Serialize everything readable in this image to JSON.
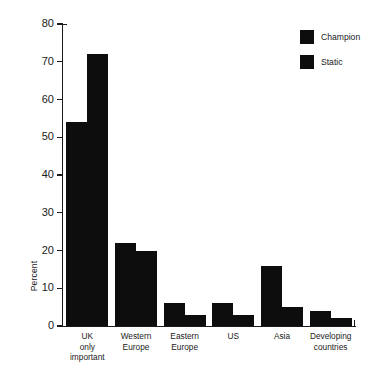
{
  "chart_data": {
    "type": "bar",
    "title": "",
    "xlabel": "",
    "ylabel": "Percent",
    "ylim": [
      0,
      80
    ],
    "ytick_step": 10,
    "grid": false,
    "legend_position": "top-right",
    "categories": [
      "UK\nonly\nimportant",
      "Western\nEurope",
      "Eastern\nEurope",
      "US",
      "Asia",
      "Developing\ncountries"
    ],
    "ytick_labels": [
      "80",
      "70",
      "60",
      "50",
      "40",
      "30",
      "20",
      "10",
      "0"
    ],
    "ytick_values": [
      80,
      70,
      60,
      50,
      40,
      30,
      20,
      10,
      0
    ],
    "series": [
      {
        "name": "Champion",
        "color": "#0d0d0d",
        "values": [
          54,
          22,
          6,
          6,
          16,
          4
        ]
      },
      {
        "name": "Static",
        "color": "#0d0d0d",
        "values": [
          72,
          20,
          3,
          3,
          5,
          2
        ]
      }
    ]
  },
  "legend": {
    "items": [
      {
        "label": "Champion",
        "color": "#0d0d0d"
      },
      {
        "label": "Static",
        "color": "#0d0d0d"
      }
    ]
  },
  "axis": {
    "y_title": "Percent"
  }
}
